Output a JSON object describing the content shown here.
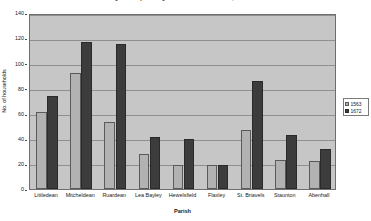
{
  "chart_data": {
    "type": "bar",
    "title": "Figure 1: Population growth in the Forest of Dean, 1563-1672",
    "xlabel": "Parish",
    "ylabel": "No. of households",
    "ylim": [
      0,
      140
    ],
    "ytick_labels": [
      "0",
      "20",
      "40",
      "60",
      "80",
      "100",
      "120",
      "140"
    ],
    "ytick_values": [
      0,
      20,
      40,
      60,
      80,
      100,
      120,
      140
    ],
    "grid": true,
    "legend_position": "right",
    "categories": [
      "Littledean",
      "Mitcheldean",
      "Ruardean",
      "Lea Bayley",
      "Hewelsfield",
      "Flaxley",
      "St. Briavels",
      "Staunton",
      "Abenhall"
    ],
    "series": [
      {
        "name": "1563",
        "color": "#b2b2b2",
        "values": [
          61,
          92,
          53,
          28,
          19,
          19,
          47,
          23,
          22
        ]
      },
      {
        "name": "1672",
        "color": "#3c3c3c",
        "values": [
          74,
          117,
          115,
          41,
          40,
          19,
          86,
          43,
          32
        ]
      }
    ]
  }
}
